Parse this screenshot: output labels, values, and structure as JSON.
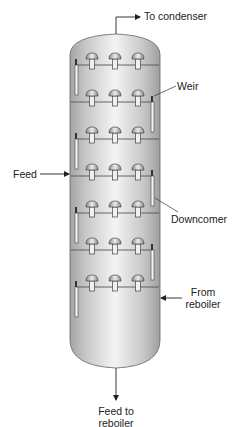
{
  "diagram": {
    "labels": {
      "to_condenser": "To condenser",
      "weir": "Weir",
      "feed": "Feed",
      "downcomer": "Downcomer",
      "from_reboiler_line1": "From",
      "from_reboiler_line2": "reboiler",
      "feed_to_reboiler_line1": "Feed to",
      "feed_to_reboiler_line2": "reboiler"
    },
    "column": {
      "tray_count": 7,
      "bubble_caps_per_tray": 3,
      "fill_light": "#f2f2f2",
      "fill_dark": "#a8a8a8",
      "stroke": "#555555"
    },
    "trays": [
      {
        "y": 65,
        "downcomer_side": "left"
      },
      {
        "y": 102,
        "downcomer_side": "right"
      },
      {
        "y": 139,
        "downcomer_side": "left"
      },
      {
        "y": 176,
        "downcomer_side": "right"
      },
      {
        "y": 213,
        "downcomer_side": "left"
      },
      {
        "y": 250,
        "downcomer_side": "right"
      },
      {
        "y": 287,
        "downcomer_side": "left"
      }
    ]
  }
}
